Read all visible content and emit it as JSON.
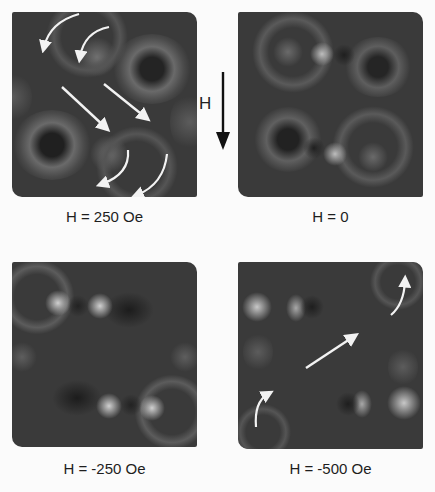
{
  "figure": {
    "field_indicator": {
      "label": "H",
      "direction": "down"
    },
    "panels": [
      {
        "id": "tl",
        "caption": "H = 250 Oe",
        "field_oe": 250,
        "position": {
          "x": 12,
          "y": 12
        },
        "arrows": [
          {
            "type": "curved",
            "from": [
              67,
              2
            ],
            "ctrl": [
              38,
              10
            ],
            "to": [
              32,
              35
            ]
          },
          {
            "type": "curved",
            "from": [
              97,
              15
            ],
            "ctrl": [
              72,
              20
            ],
            "to": [
              68,
              45
            ]
          },
          {
            "type": "straight",
            "from": [
              50,
              75
            ],
            "to": [
              95,
              117
            ]
          },
          {
            "type": "straight",
            "from": [
              92,
              72
            ],
            "to": [
              135,
              107
            ]
          },
          {
            "type": "curved",
            "from": [
              116,
              138
            ],
            "ctrl": [
              118,
              162
            ],
            "to": [
              90,
              172
            ]
          },
          {
            "type": "curved",
            "from": [
              155,
              142
            ],
            "ctrl": [
              152,
              172
            ],
            "to": [
              125,
              183
            ]
          }
        ]
      },
      {
        "id": "tr",
        "caption": "H = 0",
        "field_oe": 0,
        "position": {
          "x": 238,
          "y": 12
        },
        "arrows": []
      },
      {
        "id": "bl",
        "caption": "H = -250 Oe",
        "field_oe": -250,
        "position": {
          "x": 12,
          "y": 262
        },
        "arrows": []
      },
      {
        "id": "br",
        "caption": "H = -500 Oe",
        "field_oe": -500,
        "position": {
          "x": 238,
          "y": 262
        },
        "arrows": [
          {
            "type": "curved",
            "from": [
              153,
              53
            ],
            "ctrl": [
              166,
              42
            ],
            "to": [
              167,
              17
            ]
          },
          {
            "type": "straight",
            "from": [
              68,
              106
            ],
            "to": [
              117,
              73
            ]
          },
          {
            "type": "curved",
            "from": [
              18,
              165
            ],
            "ctrl": [
              16,
              140
            ],
            "to": [
              32,
              130
            ]
          }
        ]
      }
    ]
  }
}
